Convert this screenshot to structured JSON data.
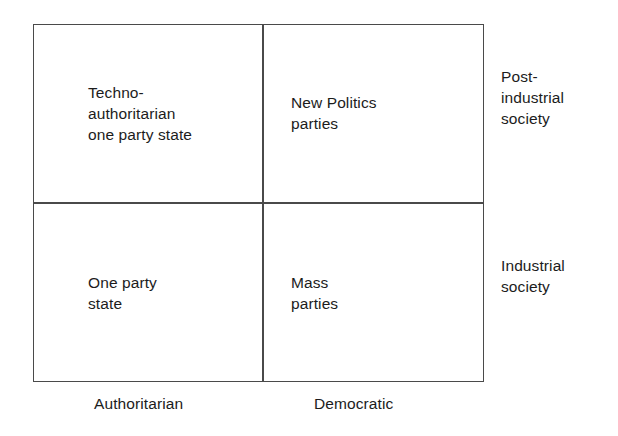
{
  "diagram": {
    "type": "two-by-two-matrix",
    "frame_color": "#4a4a4a",
    "background_color": "#ffffff",
    "text_color": "#1c1c1c",
    "quadrants": [
      {
        "id": "top-left",
        "row": "post-industrial society",
        "column": "Authoritarian",
        "label": "Techno-\nauthoritarian\none party state"
      },
      {
        "id": "top-right",
        "row": "post-industrial society",
        "column": "Democratic",
        "label": "New Politics\nparties"
      },
      {
        "id": "bottom-left",
        "row": "industrial society",
        "column": "Authoritarian",
        "label": "One party\nstate"
      },
      {
        "id": "bottom-right",
        "row": "industrial society",
        "column": "Democratic",
        "label": "Mass\nparties"
      }
    ],
    "row_labels": [
      {
        "id": "row-top",
        "label": "Post-\nindustrial\nsociety"
      },
      {
        "id": "row-bottom",
        "label": "Industrial\nsociety"
      }
    ],
    "column_labels": [
      {
        "id": "column-left",
        "label": "Authoritarian"
      },
      {
        "id": "column-right",
        "label": "Democratic"
      }
    ]
  }
}
